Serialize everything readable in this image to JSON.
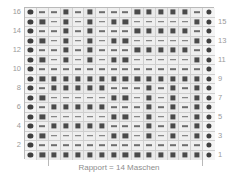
{
  "chart_data": {
    "type": "table",
    "title": "",
    "caption": "Rapport = 14 Maschen",
    "rows": 16,
    "columns": 16,
    "symbol_legend": {
      "dot": "edge stitch marker (circle)",
      "dash": "purl stitch (dash)",
      "square": "knit stitch (filled square)"
    },
    "row_numbers_left": [
      "16",
      "14",
      "12",
      "10",
      "8",
      "6",
      "4",
      "2"
    ],
    "row_numbers_right": [
      "15",
      "13",
      "11",
      "9",
      "7",
      "5",
      "3",
      "1"
    ],
    "grid": [
      [
        "dot",
        "dash",
        "dash",
        "sq",
        "dash",
        "sq",
        "dash",
        "dash",
        "dash",
        "sq",
        "sq",
        "sq",
        "sq",
        "sq",
        "dash",
        "dot"
      ],
      [
        "dot",
        "sq",
        "dash",
        "sq",
        "dash",
        "sq",
        "dash",
        "sq",
        "sq",
        "dash",
        "dash",
        "dash",
        "dash",
        "dash",
        "sq",
        "dot"
      ],
      [
        "dot",
        "dash",
        "dash",
        "sq",
        "dash",
        "sq",
        "dash",
        "dash",
        "dash",
        "sq",
        "sq",
        "sq",
        "sq",
        "sq",
        "dash",
        "dot"
      ],
      [
        "dot",
        "sq",
        "dash",
        "sq",
        "dash",
        "sq",
        "dash",
        "sq",
        "sq",
        "dash",
        "dash",
        "dash",
        "dash",
        "dash",
        "sq",
        "dot"
      ],
      [
        "dot",
        "dash",
        "dash",
        "sq",
        "dash",
        "sq",
        "dash",
        "dash",
        "dash",
        "sq",
        "sq",
        "sq",
        "sq",
        "sq",
        "dash",
        "dot"
      ],
      [
        "dot",
        "sq",
        "dash",
        "sq",
        "dash",
        "sq",
        "dash",
        "sq",
        "sq",
        "dash",
        "dash",
        "dash",
        "dash",
        "dash",
        "sq",
        "dot"
      ],
      [
        "dot",
        "dash",
        "dash",
        "dash",
        "dash",
        "dash",
        "dash",
        "dash",
        "dash",
        "dash",
        "dash",
        "dash",
        "dash",
        "dash",
        "dash",
        "dot"
      ],
      [
        "dot",
        "sq",
        "sq",
        "sq",
        "sq",
        "sq",
        "sq",
        "sq",
        "sq",
        "sq",
        "sq",
        "sq",
        "sq",
        "sq",
        "sq",
        "dot"
      ],
      [
        "dot",
        "dash",
        "sq",
        "sq",
        "sq",
        "sq",
        "sq",
        "dash",
        "dash",
        "dash",
        "sq",
        "dash",
        "sq",
        "dash",
        "sq",
        "dot"
      ],
      [
        "dot",
        "sq",
        "dash",
        "dash",
        "dash",
        "dash",
        "dash",
        "sq",
        "sq",
        "dash",
        "sq",
        "dash",
        "sq",
        "dash",
        "sq",
        "dot"
      ],
      [
        "dot",
        "dash",
        "sq",
        "sq",
        "sq",
        "sq",
        "sq",
        "dash",
        "dash",
        "dash",
        "sq",
        "dash",
        "sq",
        "dash",
        "sq",
        "dot"
      ],
      [
        "dot",
        "sq",
        "dash",
        "dash",
        "dash",
        "dash",
        "dash",
        "sq",
        "sq",
        "dash",
        "sq",
        "dash",
        "sq",
        "dash",
        "sq",
        "dot"
      ],
      [
        "dot",
        "dash",
        "sq",
        "sq",
        "sq",
        "sq",
        "sq",
        "dash",
        "dash",
        "dash",
        "sq",
        "dash",
        "sq",
        "dash",
        "sq",
        "dot"
      ],
      [
        "dot",
        "sq",
        "dash",
        "dash",
        "dash",
        "dash",
        "dash",
        "sq",
        "sq",
        "dash",
        "sq",
        "dash",
        "sq",
        "dash",
        "sq",
        "dot"
      ],
      [
        "dot",
        "dash",
        "dash",
        "dash",
        "dash",
        "dash",
        "dash",
        "dash",
        "dash",
        "dash",
        "dash",
        "dash",
        "dash",
        "dash",
        "dash",
        "dot"
      ],
      [
        "dot",
        "sq",
        "sq",
        "sq",
        "sq",
        "sq",
        "sq",
        "sq",
        "sq",
        "sq",
        "sq",
        "sq",
        "sq",
        "sq",
        "sq",
        "dot"
      ]
    ]
  }
}
